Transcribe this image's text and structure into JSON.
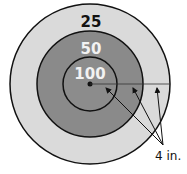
{
  "diagram": {
    "rings": [
      {
        "label": "25",
        "fill": "#dadada",
        "text_color": "#111111"
      },
      {
        "label": "50",
        "fill": "#8a8a8a",
        "text_color": "#f2f2f2"
      },
      {
        "label": "100",
        "fill": "#8c8c8c",
        "text_color": "#f2f2f2"
      }
    ],
    "measure_label": "4 in.",
    "stroke_color": "#111111"
  }
}
